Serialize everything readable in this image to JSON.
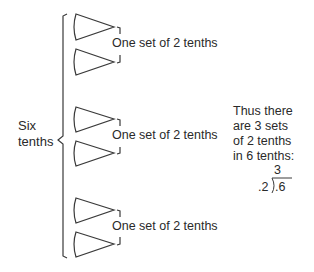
{
  "diagram": {
    "group_label": "Six tenths",
    "group_label_lines": [
      "Six",
      "tenths"
    ],
    "wedge_count": 6,
    "sets": [
      {
        "label": "One set of 2 tenths"
      },
      {
        "label": "One set of 2 tenths"
      },
      {
        "label": "One set of 2 tenths"
      }
    ],
    "conclusion_lines": [
      "Thus there",
      "are 3 sets",
      "of 2 tenths",
      "in 6 tenths:"
    ],
    "division": {
      "quotient": "3",
      "divisor": ".2",
      "dividend": ".6"
    },
    "stroke_color": "#3a3a3a"
  }
}
